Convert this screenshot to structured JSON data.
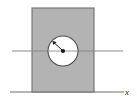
{
  "figure": {
    "type": "mechanics-diagram",
    "background_color": "#ffffff",
    "axis_label": "x",
    "block": {
      "name": "rectangular-block",
      "fill_color": "#b3b3b3",
      "stroke_color": "#6e6e6e",
      "x": 32,
      "y": 8,
      "width": 62,
      "height": 84
    },
    "circle": {
      "name": "circular-hole",
      "fill_color": "#ffffff",
      "stroke_color": "#4d4d4d",
      "center_x": 63,
      "center_y": 51,
      "radius": 15
    },
    "center_dot": {
      "name": "center-point",
      "fill_color": "#1a1a1a",
      "radius": 2.1,
      "x": 63,
      "y": 51
    },
    "radius_arrow": {
      "name": "radius-arrow",
      "stroke_color": "#1a1a1a",
      "from_x": 63,
      "from_y": 51,
      "to_x": 53,
      "to_y": 41.5
    },
    "horizontal_axis": {
      "name": "horizontal-center-line",
      "stroke_color": "#8a8a8a",
      "x1": 12,
      "y1": 51,
      "x2": 123,
      "y2": 51
    },
    "ground_line": {
      "name": "ground-line",
      "stroke_color": "#6e6e6e",
      "x1": 10,
      "y1": 92,
      "x2": 124,
      "y2": 92
    },
    "axis_label_position": {
      "x": 128,
      "y": 95
    }
  }
}
